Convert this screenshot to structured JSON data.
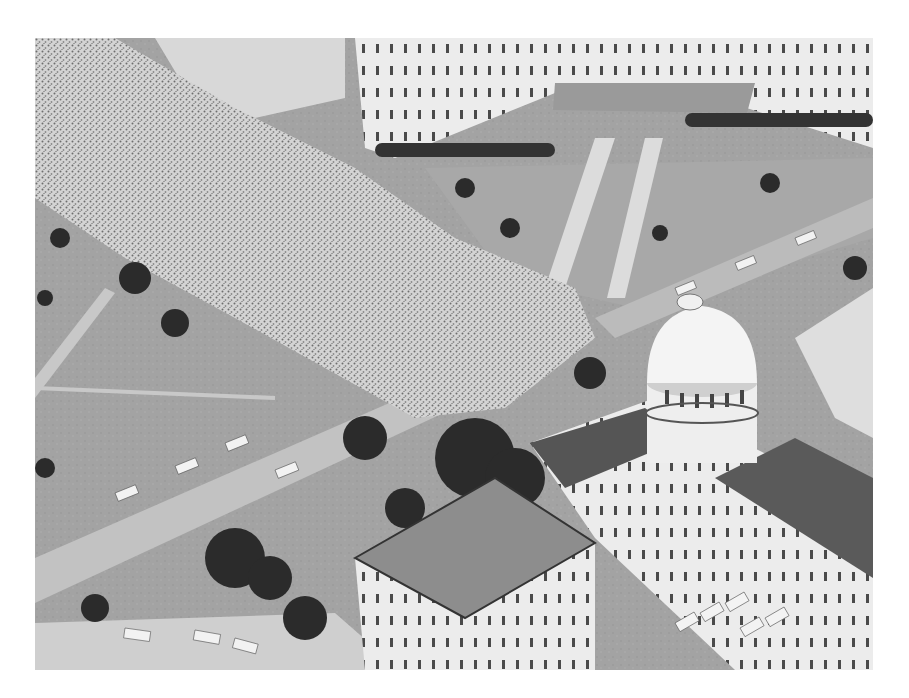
{
  "image": {
    "kind": "black-and-white aerial photograph",
    "subject": "large crowd gathered on a street and lawn in front of a domed capitol building with adjacent office buildings",
    "alt": "Aerial view of a massive crowd filling a street beside a domed capitol building",
    "palette": {
      "page_bg": "#ffffff",
      "lawn": "#9c9c9c",
      "crowd": "#cfcfcf",
      "building": "#eeeeee",
      "roof": "#555555",
      "tree": "#2a2a2a",
      "road": "#bdbdbd"
    }
  }
}
